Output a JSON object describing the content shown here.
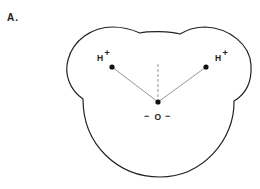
{
  "figure": {
    "panel_label": "A.",
    "atoms": {
      "hydrogen_left": {
        "symbol": "H",
        "charge": "+"
      },
      "hydrogen_right": {
        "symbol": "H",
        "charge": "+"
      },
      "oxygen": {
        "symbol": "O",
        "charge_left": "−",
        "charge_right": "−"
      }
    },
    "colors": {
      "outline": "#222222",
      "bond": "#8a8a8a",
      "dashed_axis": "#8a8a8a",
      "atom_dot": "#111111"
    }
  }
}
